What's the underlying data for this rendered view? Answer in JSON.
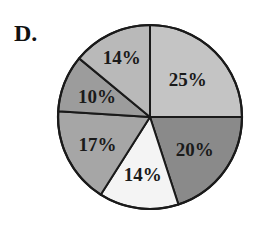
{
  "option_label": "D.",
  "chart_data": {
    "type": "pie",
    "title": "",
    "start_angle_deg": 0,
    "direction": "clockwise",
    "categories": [
      "A",
      "B",
      "C",
      "D",
      "E",
      "F"
    ],
    "values": [
      25,
      20,
      14,
      17,
      10,
      14
    ],
    "labels": [
      "25%",
      "20%",
      "14%",
      "17%",
      "10%",
      "14%"
    ],
    "colors": [
      "#c4c4c4",
      "#8a8a8a",
      "#f4f4f4",
      "#a6a6a6",
      "#9c9c9c",
      "#b9b9b9"
    ],
    "legend": "none"
  }
}
